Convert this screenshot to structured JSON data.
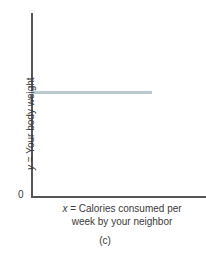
{
  "chart_data": {
    "type": "line",
    "title": "",
    "subtitle": "",
    "caption": "(c)",
    "xlabel_line1": "x = Calories consumed per",
    "xlabel_line2": "week by your neighbor",
    "xlabel_var": "x",
    "xlabel_text_line1": "= Calories consumed per",
    "xlabel_full": "x = Calories consumed per week by your neighbor",
    "ylabel_var": "y",
    "ylabel_text": "= Your body weight",
    "ylabel_full": "y = Your body weight",
    "origin_label": "0",
    "grid": false,
    "legend": false,
    "xlim": [
      0,
      1
    ],
    "ylim": [
      0,
      1
    ],
    "xticks": [],
    "yticks": [],
    "xtick_labels": [],
    "ytick_labels": [],
    "series": [
      {
        "name": "Your body weight vs neighbor's calories",
        "relationship": "no correlation (zero slope)",
        "color": "#b9c9cd",
        "x": [
          0.0,
          1.0
        ],
        "y": [
          0.57,
          0.57
        ]
      }
    ],
    "axis_color": "#555557",
    "background_color": "#ffffff"
  },
  "figure": {
    "axis_color": "#555557",
    "series_color": "#b9c9cd",
    "background_color": "#ffffff"
  }
}
